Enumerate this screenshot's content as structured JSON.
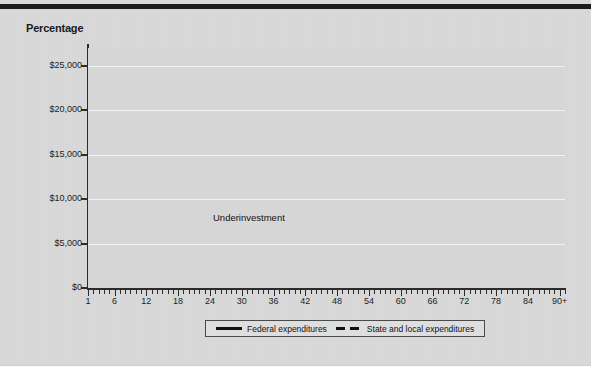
{
  "page": {
    "background_color": "#d9d9d9",
    "rule_color": "#1b1b1b"
  },
  "chart_data": {
    "type": "line",
    "title": "Percentage",
    "xlabel": "",
    "ylabel": "",
    "grid": true,
    "legend_position": "bottom",
    "xlim": [
      1,
      91
    ],
    "ylim": [
      0,
      27000
    ],
    "ytick_labels": [
      "$25,000",
      "$20,000",
      "$15,000",
      "$10,000",
      "$5,000",
      "$0"
    ],
    "ytick_values": [
      25000,
      20000,
      15000,
      10000,
      5000,
      0
    ],
    "xtick_labels": [
      "1",
      "6",
      "12",
      "18",
      "24",
      "30",
      "36",
      "42",
      "48",
      "54",
      "60",
      "66",
      "72",
      "78",
      "84",
      "90+"
    ],
    "xtick_values": [
      1,
      6,
      12,
      18,
      24,
      30,
      36,
      42,
      48,
      54,
      60,
      66,
      72,
      78,
      84,
      90
    ],
    "annotations": [
      {
        "text": "Underinvestment",
        "target_x": 3,
        "target_y": 3000
      }
    ],
    "series": [
      {
        "name": "Federal expenditures",
        "style": "solid",
        "color": "#111111",
        "x": [
          1,
          2,
          3,
          4,
          5,
          6,
          8,
          10,
          12,
          14,
          16,
          18,
          20,
          22,
          24,
          26,
          28,
          30,
          32,
          34,
          36,
          38,
          40,
          42,
          44,
          46,
          48,
          50,
          52,
          54,
          55,
          56,
          57,
          58,
          59,
          60,
          61,
          62,
          63,
          64,
          64.5,
          65,
          65.5,
          66,
          67,
          68,
          69,
          70,
          71,
          72,
          73,
          74,
          75,
          76,
          77,
          78,
          79,
          80,
          81,
          82,
          83,
          84,
          85,
          86,
          87,
          88,
          89,
          90,
          90.5,
          91
        ],
        "values": [
          3000,
          3000,
          3000,
          3100,
          3100,
          3150,
          3200,
          3250,
          3300,
          3350,
          3400,
          3450,
          3500,
          3550,
          3600,
          3650,
          3700,
          3750,
          3800,
          3900,
          4000,
          4050,
          4100,
          4200,
          4300,
          4400,
          4500,
          4650,
          4800,
          5000,
          5100,
          5300,
          5500,
          6200,
          7200,
          8600,
          10200,
          12200,
          14400,
          16300,
          17200,
          17400,
          17500,
          17600,
          18000,
          18300,
          18400,
          18600,
          19000,
          19300,
          23500,
          24300,
          24600,
          24500,
          24700,
          24400,
          24600,
          24400,
          24600,
          24500,
          25000,
          25200,
          25000,
          25300,
          25200,
          25000,
          24600,
          24200,
          23700,
          24600
        ]
      },
      {
        "name": "State and local expenditures",
        "style": "dashed",
        "color": "#111111",
        "x": [
          1,
          2,
          3,
          4,
          4.5,
          5,
          5.5,
          6,
          7,
          8,
          10,
          12,
          14,
          16,
          17,
          18,
          19,
          20,
          21,
          22,
          23,
          24,
          25,
          26,
          27,
          28,
          29,
          30,
          31,
          32,
          33,
          34,
          35,
          36,
          38,
          40,
          42,
          44,
          46,
          48,
          50,
          52,
          54,
          56,
          58,
          60,
          62,
          64,
          66,
          67,
          68,
          69,
          70,
          71,
          72,
          73,
          74,
          75,
          76,
          77,
          78,
          79,
          80,
          81,
          82,
          83,
          84,
          85,
          86,
          87,
          88,
          89,
          90,
          90.5,
          91
        ],
        "values": [
          3000,
          3000,
          3000,
          3050,
          5000,
          9000,
          11000,
          11500,
          11700,
          11750,
          11800,
          11800,
          11800,
          11750,
          11600,
          11200,
          10400,
          9400,
          8300,
          7200,
          6200,
          5400,
          4800,
          4400,
          4200,
          4150,
          4100,
          4100,
          4100,
          4100,
          4050,
          3700,
          3650,
          3650,
          3700,
          3700,
          3700,
          3700,
          3700,
          3700,
          3700,
          3700,
          3700,
          3750,
          3800,
          3850,
          3900,
          3950,
          4000,
          4400,
          5000,
          5500,
          5800,
          6000,
          6200,
          6400,
          6600,
          6800,
          7400,
          8200,
          9200,
          10400,
          11600,
          12800,
          14000,
          15400,
          16800,
          18000,
          19000,
          19800,
          20600,
          21600,
          23200,
          24600,
          24400
        ]
      }
    ]
  },
  "legend": {
    "items": [
      {
        "label": "Federal expenditures",
        "style": "solid"
      },
      {
        "label": "State and local expenditures",
        "style": "dashed"
      }
    ]
  }
}
